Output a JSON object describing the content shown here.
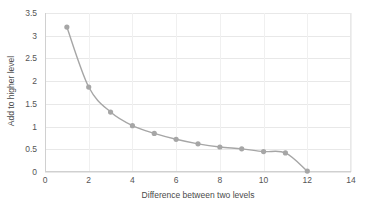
{
  "chart_data": {
    "type": "line",
    "title": "",
    "xlabel": "Difference between  two levels",
    "ylabel": "Add to higher level",
    "xlim": [
      0,
      14
    ],
    "ylim": [
      0,
      3.5
    ],
    "xticks": [
      0,
      2,
      4,
      6,
      8,
      10,
      12,
      14
    ],
    "yticks": [
      0,
      0.5,
      1,
      1.5,
      2,
      2.5,
      3,
      3.5
    ],
    "grid": true,
    "legend": "none",
    "marker": "circle",
    "series_color": "#a6a6a6",
    "x": [
      1,
      2,
      3,
      4,
      5,
      6,
      7,
      8,
      9,
      10,
      11,
      12
    ],
    "values": [
      3.19,
      1.87,
      1.32,
      1.02,
      0.85,
      0.72,
      0.62,
      0.55,
      0.51,
      0.45,
      0.42,
      0.02
    ],
    "series": [
      {
        "name": "Add to higher level",
        "values": [
          3.19,
          1.87,
          1.32,
          1.02,
          0.85,
          0.72,
          0.62,
          0.55,
          0.51,
          0.45,
          0.42,
          0.02
        ]
      }
    ]
  },
  "axes": {
    "y_tick_labels": [
      "0",
      "0.5",
      "1",
      "1.5",
      "2",
      "2.5",
      "3",
      "3.5"
    ],
    "x_tick_labels": [
      "0",
      "2",
      "4",
      "6",
      "8",
      "10",
      "12",
      "14"
    ],
    "x_title": "Difference between  two levels",
    "y_title": "Add to higher level"
  },
  "colors": {
    "series": "#a6a6a6",
    "grid": "#e8e8e8",
    "axis": "#d0d0d0",
    "text": "#555555",
    "background": "#ffffff"
  }
}
